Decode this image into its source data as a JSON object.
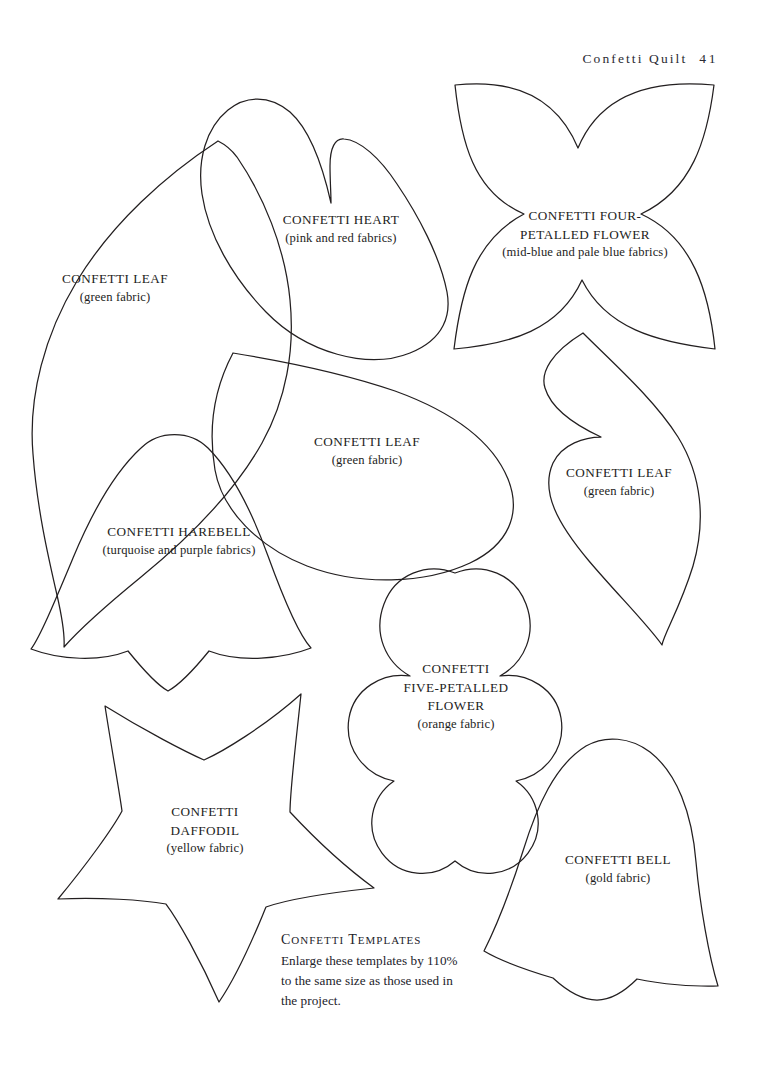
{
  "page": {
    "width": 776,
    "height": 1070,
    "background_color": "#ffffff",
    "ink_color": "#231f20",
    "running_head": {
      "title": "Confetti Quilt",
      "folio": "41"
    }
  },
  "templates": [
    {
      "key": "confetti-leaf-large",
      "title": "CONFETTI LEAF",
      "fabric": "(green fabric)",
      "shape": "leaf",
      "label_x": 115,
      "label_y": 288
    },
    {
      "key": "confetti-heart",
      "title": "CONFETTI HEART",
      "fabric": "(pink and red fabrics)",
      "shape": "heart",
      "label_x": 341,
      "label_y": 229
    },
    {
      "key": "confetti-four-petalled-flower",
      "title": "CONFETTI FOUR-PETALLED FLOWER",
      "title_lines": [
        "CONFETTI FOUR-",
        "PETALLED FLOWER"
      ],
      "fabric": "(mid-blue and pale blue fabrics)",
      "shape": "four-petal-flower",
      "label_x": 585,
      "label_y": 213
    },
    {
      "key": "confetti-leaf-middle",
      "title": "CONFETTI LEAF",
      "fabric": "(green fabric)",
      "shape": "teardrop-leaf",
      "label_x": 367,
      "label_y": 431
    },
    {
      "key": "confetti-leaf-right",
      "title": "CONFETTI LEAF",
      "fabric": "(green fabric)",
      "shape": "notched-leaf",
      "label_x": 619,
      "label_y": 466
    },
    {
      "key": "confetti-harebell",
      "title": "CONFETTI HAREBELL",
      "fabric": "(turquoise and purple fabrics)",
      "shape": "harebell",
      "label_x": 179,
      "label_y": 525
    },
    {
      "key": "confetti-five-petalled-flower",
      "title": "CONFETTI FIVE-PETALLED FLOWER",
      "title_lines": [
        "CONFETTI",
        "FIVE-PETALLED",
        "FLOWER"
      ],
      "fabric": "(orange fabric)",
      "shape": "five-petal-flower",
      "label_x": 456,
      "label_y": 661
    },
    {
      "key": "confetti-daffodil",
      "title": "CONFETTI DAFFODIL",
      "title_lines": [
        "CONFETTI",
        "DAFFODIL"
      ],
      "fabric": "(yellow fabric)",
      "shape": "five-point-star",
      "label_x": 205,
      "label_y": 803
    },
    {
      "key": "confetti-bell",
      "title": "CONFETTI BELL",
      "fabric": "(gold fabric)",
      "shape": "bell",
      "label_x": 618,
      "label_y": 859
    }
  ],
  "note": {
    "title": "Confetti Templates",
    "body": "Enlarge these templates by 110% to the same size as those used in the project."
  }
}
